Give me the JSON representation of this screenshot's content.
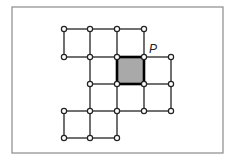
{
  "diagram": {
    "title": "",
    "frame": {
      "x": 12,
      "y": 7,
      "width": 211,
      "height": 146,
      "stroke": "#8a8a8a"
    },
    "grid": {
      "columns_x": [
        64,
        90,
        117,
        144,
        171
      ],
      "rows_y": [
        29,
        57,
        84,
        111,
        138
      ]
    },
    "nodes": [
      {
        "c": 0,
        "r": 0
      },
      {
        "c": 1,
        "r": 0
      },
      {
        "c": 2,
        "r": 0
      },
      {
        "c": 3,
        "r": 0
      },
      {
        "c": 0,
        "r": 1
      },
      {
        "c": 1,
        "r": 1
      },
      {
        "c": 2,
        "r": 1
      },
      {
        "c": 3,
        "r": 1
      },
      {
        "c": 4,
        "r": 1
      },
      {
        "c": 1,
        "r": 2
      },
      {
        "c": 2,
        "r": 2
      },
      {
        "c": 3,
        "r": 2
      },
      {
        "c": 4,
        "r": 2
      },
      {
        "c": 0,
        "r": 3
      },
      {
        "c": 1,
        "r": 3
      },
      {
        "c": 2,
        "r": 3
      },
      {
        "c": 3,
        "r": 3
      },
      {
        "c": 4,
        "r": 3
      },
      {
        "c": 0,
        "r": 4
      },
      {
        "c": 1,
        "r": 4
      },
      {
        "c": 2,
        "r": 4
      }
    ],
    "edges": [
      [
        0,
        0,
        1,
        0
      ],
      [
        1,
        0,
        2,
        0
      ],
      [
        2,
        0,
        3,
        0
      ],
      [
        0,
        1,
        1,
        1
      ],
      [
        1,
        1,
        2,
        1
      ],
      [
        2,
        1,
        3,
        1
      ],
      [
        3,
        1,
        4,
        1
      ],
      [
        1,
        2,
        2,
        2
      ],
      [
        2,
        2,
        3,
        2
      ],
      [
        3,
        2,
        4,
        2
      ],
      [
        0,
        3,
        1,
        3
      ],
      [
        1,
        3,
        2,
        3
      ],
      [
        2,
        3,
        3,
        3
      ],
      [
        3,
        3,
        4,
        3
      ],
      [
        0,
        4,
        1,
        4
      ],
      [
        1,
        4,
        2,
        4
      ],
      [
        0,
        0,
        0,
        1
      ],
      [
        0,
        3,
        0,
        4
      ],
      [
        1,
        0,
        1,
        1
      ],
      [
        1,
        1,
        1,
        2
      ],
      [
        1,
        2,
        1,
        3
      ],
      [
        1,
        3,
        1,
        4
      ],
      [
        2,
        0,
        2,
        1
      ],
      [
        2,
        1,
        2,
        2
      ],
      [
        2,
        2,
        2,
        3
      ],
      [
        2,
        3,
        2,
        4
      ],
      [
        3,
        0,
        3,
        1
      ],
      [
        3,
        1,
        3,
        2
      ],
      [
        3,
        2,
        3,
        3
      ],
      [
        4,
        1,
        4,
        2
      ],
      [
        4,
        2,
        4,
        3
      ]
    ],
    "shaded_square": {
      "c": 2,
      "r": 1,
      "fill": "#a9a9a9"
    },
    "point_label": {
      "text": "P",
      "c": 3,
      "r": 1,
      "dx": 5,
      "dy": -4
    }
  }
}
